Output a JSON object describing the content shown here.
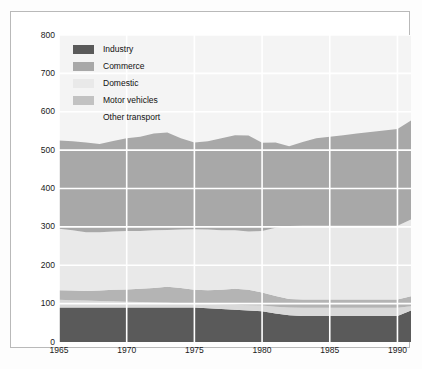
{
  "chart_data": {
    "type": "area",
    "stacked": true,
    "title": "",
    "subtitle": "",
    "xlabel": "",
    "ylabel": "Energy supplied (petajoules)",
    "xlim": [
      1965,
      1991
    ],
    "ylim": [
      0,
      800
    ],
    "ytick_labels": [
      "0",
      "100",
      "200",
      "300",
      "400",
      "500",
      "600",
      "700",
      "800"
    ],
    "ytick_values": [
      0,
      100,
      200,
      300,
      400,
      500,
      600,
      700,
      800
    ],
    "xtick_labels": [
      "1965",
      "1970",
      "1975",
      "1980",
      "1985",
      "1990"
    ],
    "xtick_values": [
      1965,
      1970,
      1975,
      1980,
      1985,
      1990
    ],
    "grid": true,
    "grid_color": "#ffffff",
    "plot_background": "#f4f4f4",
    "legend_position": "top-left",
    "x": [
      1965,
      1966,
      1967,
      1968,
      1969,
      1970,
      1971,
      1972,
      1973,
      1974,
      1975,
      1976,
      1977,
      1978,
      1979,
      1980,
      1981,
      1982,
      1983,
      1984,
      1985,
      1986,
      1987,
      1988,
      1989,
      1990,
      1991
    ],
    "series": [
      {
        "name": "Industry",
        "color": "#5a5a5a",
        "values": [
          90,
          90,
          90,
          90,
          90,
          90,
          90,
          90,
          90,
          90,
          90,
          88,
          86,
          84,
          82,
          80,
          74,
          70,
          68,
          68,
          68,
          68,
          68,
          68,
          68,
          68,
          82
        ]
      },
      {
        "name": "Other transport",
        "color": "#d9d9d9",
        "values": [
          20,
          19,
          18,
          17,
          16,
          15,
          14,
          13,
          12,
          11,
          10,
          11,
          12,
          13,
          14,
          15,
          18,
          20,
          21,
          21,
          21,
          21,
          21,
          21,
          21,
          21,
          11
        ]
      },
      {
        "name": "Motor vehicles",
        "color": "#b4b4b4",
        "values": [
          25,
          25,
          25,
          27,
          30,
          32,
          35,
          38,
          42,
          40,
          36,
          36,
          38,
          42,
          40,
          34,
          28,
          22,
          22,
          22,
          22,
          22,
          22,
          22,
          22,
          22,
          26
        ]
      },
      {
        "name": "Domestic",
        "color": "#e9e9e9",
        "values": [
          160,
          157,
          153,
          152,
          152,
          152,
          150,
          150,
          148,
          152,
          158,
          158,
          155,
          152,
          152,
          160,
          178,
          190,
          192,
          192,
          192,
          192,
          192,
          192,
          192,
          192,
          200
        ]
      },
      {
        "name": "Commerce",
        "color": "#a8a8a8",
        "values": [
          230,
          232,
          234,
          230,
          236,
          242,
          246,
          252,
          254,
          238,
          226,
          230,
          240,
          248,
          250,
          230,
          222,
          208,
          218,
          228,
          232,
          236,
          240,
          244,
          248,
          252,
          258
        ]
      }
    ]
  },
  "legend": {
    "items": [
      {
        "label": "Industry",
        "color": "#5a5a5a",
        "swatch": true
      },
      {
        "label": "Commerce",
        "color": "#a8a8a8",
        "swatch": true
      },
      {
        "label": "Domestic",
        "color": "#e9e9e9",
        "swatch": true
      },
      {
        "label": "Motor vehicles",
        "color": "#c2c2c2",
        "swatch": true
      },
      {
        "label": "Other transport",
        "color": "#ffffff",
        "swatch": false
      }
    ]
  }
}
